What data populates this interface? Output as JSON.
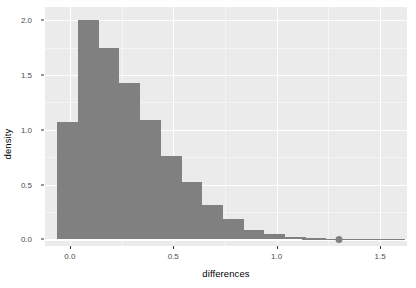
{
  "chart_data": {
    "type": "bar",
    "title": "",
    "subtitle": "",
    "xlabel": "differences",
    "ylabel": "density",
    "xlim": [
      -0.12,
      1.63
    ],
    "ylim": [
      -0.06,
      2.12
    ],
    "xticks": [
      0.0,
      0.5,
      1.0,
      1.5
    ],
    "xticklabels": [
      "0.0",
      "0.5",
      "1.0",
      "1.5"
    ],
    "yticks": [
      0.0,
      0.5,
      1.0,
      1.5,
      2.0
    ],
    "yticklabels": [
      "0.0",
      "0.5",
      "1.0",
      "1.5",
      "2.0"
    ],
    "grid": true,
    "legend": false,
    "bar_color": "#808080",
    "panel_color": "#ebebeb",
    "gridline_color": "#ffffff",
    "binwidth": 0.1,
    "bin_starts": [
      -0.06,
      0.04,
      0.14,
      0.24,
      0.34,
      0.44,
      0.54,
      0.64,
      0.74,
      0.84,
      0.94,
      1.04,
      1.14
    ],
    "values": [
      1.07,
      2.0,
      1.75,
      1.43,
      1.09,
      0.76,
      0.52,
      0.31,
      0.19,
      0.09,
      0.05,
      0.02,
      0.01
    ],
    "annotation_point": {
      "x": 1.3,
      "y": 0.0,
      "color": "#808080",
      "shape": "circle"
    },
    "rug_segment": {
      "x_start": 1.12,
      "x_end": 1.62,
      "y": 0.0,
      "color": "#808080"
    }
  }
}
